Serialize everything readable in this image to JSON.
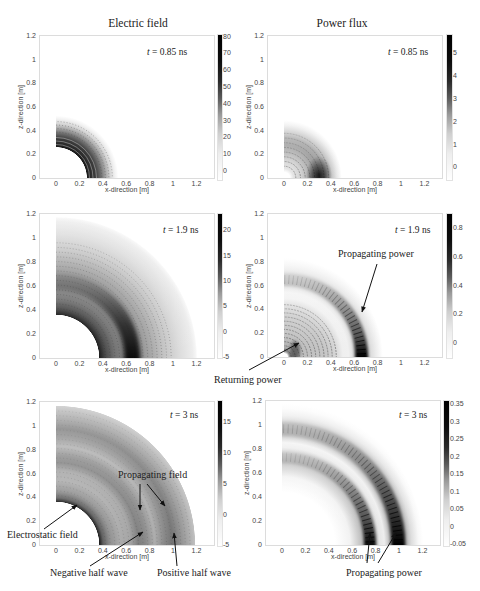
{
  "figure": {
    "column_titles": [
      "Electric field",
      "Power flux"
    ]
  },
  "chart_data": [
    {
      "type": "heatmap",
      "title": "Electric field",
      "time": {
        "symbol": "t",
        "value": "= 0.85 ns"
      },
      "xlabel": "x-direction [m]",
      "ylabel": "z-direction [m]",
      "xlim": [
        -0.137,
        1.35
      ],
      "ylim": [
        0,
        1.2
      ],
      "xticks": [
        0,
        0.2,
        0.4,
        0.6,
        0.8,
        1,
        1.2
      ],
      "yticks": [
        0,
        0.2,
        0.4,
        0.6,
        0.8,
        1,
        1.2
      ],
      "colorbar": {
        "range": [
          -5.4,
          81
        ],
        "ticks": [
          0,
          10,
          20,
          30,
          40,
          50,
          60,
          70,
          80
        ],
        "colormap": "inverted gray"
      },
      "grid": false,
      "bands": [
        {
          "r_m": [
            0.26,
            0.38
          ],
          "level": "high"
        },
        {
          "r_m": [
            0.38,
            0.5
          ],
          "level": "fading"
        }
      ],
      "annotations": []
    },
    {
      "type": "heatmap",
      "title": "Power flux",
      "time": {
        "symbol": "t",
        "value": "= 0.85 ns"
      },
      "xlabel": "x-direction [m]",
      "ylabel": "z-direction [m]",
      "xlim": [
        -0.137,
        1.35
      ],
      "ylim": [
        0,
        1.2
      ],
      "xticks": [
        0,
        0.2,
        0.4,
        0.6,
        0.8,
        1,
        1.2
      ],
      "yticks": [
        0,
        0.2,
        0.4,
        0.6,
        0.8,
        1,
        1.2
      ],
      "colorbar": {
        "range": [
          -0.55,
          5.8
        ],
        "ticks": [
          0,
          1,
          2,
          3,
          4,
          5
        ],
        "colormap": "inverted gray"
      },
      "grid": false,
      "bands": [
        {
          "r_m": [
            0.08,
            0.45
          ],
          "level": "moderate"
        },
        {
          "peak_at_m": [
            0.3,
            0.03
          ],
          "level": "high"
        }
      ],
      "annotations": []
    },
    {
      "type": "heatmap",
      "title": "Electric field",
      "time": {
        "symbol": "t",
        "value": "= 1.9 ns"
      },
      "xlabel": "x-direction [m]",
      "ylabel": "z-direction [m]",
      "xlim": [
        -0.137,
        1.35
      ],
      "ylim": [
        0,
        1.2
      ],
      "xticks": [
        0,
        0.2,
        0.4,
        0.6,
        0.8,
        1,
        1.2
      ],
      "yticks": [
        0,
        0.2,
        0.4,
        0.6,
        0.8,
        1,
        1.2
      ],
      "colorbar": {
        "range": [
          -5.2,
          23.2
        ],
        "ticks": [
          -5,
          0,
          5,
          10,
          15,
          20
        ],
        "colormap": "inverted gray"
      },
      "grid": false,
      "bands": [
        {
          "r_m": [
            0.37,
            0.42
          ],
          "level": "high"
        },
        {
          "r_m": [
            0.58,
            0.72
          ],
          "level": "high"
        },
        {
          "r_m": [
            0.72,
            1.2
          ],
          "level": "fading"
        }
      ],
      "annotations": []
    },
    {
      "type": "heatmap",
      "title": "Power flux",
      "time": {
        "symbol": "t",
        "value": "= 1.9 ns"
      },
      "xlabel": "x-direction [m]",
      "ylabel": "z-direction [m]",
      "xlim": [
        -0.137,
        1.35
      ],
      "ylim": [
        0,
        1.2
      ],
      "xticks": [
        0,
        0.2,
        0.4,
        0.6,
        0.8,
        1,
        1.2
      ],
      "yticks": [
        0,
        0.2,
        0.4,
        0.6,
        0.8,
        1,
        1.2
      ],
      "colorbar": {
        "range": [
          -0.105,
          0.9
        ],
        "ticks": [
          0,
          0.2,
          0.4,
          0.6,
          0.8
        ],
        "colormap": "inverted gray"
      },
      "grid": false,
      "bands": [
        {
          "r_m": [
            0.05,
            0.45
          ],
          "level": "moderate"
        },
        {
          "r_m": [
            0.58,
            0.74
          ],
          "level": "high"
        }
      ],
      "annotations": [
        {
          "text": "Propagating power",
          "target_m": [
            0.66,
            0.38
          ]
        },
        {
          "text": "Returning power",
          "target_m": [
            0.13,
            0.12
          ]
        }
      ]
    },
    {
      "type": "heatmap",
      "title": "Electric field",
      "time": {
        "symbol": "t",
        "value": "= 3 ns"
      },
      "xlabel": "x-direction [m]",
      "ylabel": "z-direction [m]",
      "xlim": [
        -0.137,
        1.35
      ],
      "ylim": [
        0,
        1.2
      ],
      "xticks": [
        0,
        0.2,
        0.4,
        0.6,
        0.8,
        1,
        1.2
      ],
      "yticks": [
        0,
        0.2,
        0.4,
        0.6,
        0.8,
        1,
        1.2
      ],
      "colorbar": {
        "range": [
          -5.1,
          18.4
        ],
        "ticks": [
          -5,
          0,
          5,
          10,
          15
        ],
        "colormap": "inverted gray"
      },
      "grid": false,
      "bands": [
        {
          "r_m": [
            0.37,
            0.4
          ],
          "level": "high"
        },
        {
          "r_m": [
            0.68,
            0.78
          ],
          "level": "negative half wave"
        },
        {
          "r_m": [
            0.92,
            1.02
          ],
          "level": "positive half wave"
        }
      ],
      "annotations": [
        {
          "text": "Propagating field",
          "target_m": [
            [
              0.72,
              0.29
            ],
            [
              0.93,
              0.33
            ]
          ]
        },
        {
          "text": "Electrostatic field",
          "target_m": [
            0.18,
            0.34
          ]
        },
        {
          "text": "Negative half wave",
          "target_m": [
            0.74,
            0.11
          ]
        },
        {
          "text": "Positive half wave",
          "target_m": [
            1.0,
            0.1
          ]
        }
      ]
    },
    {
      "type": "heatmap",
      "title": "Power flux",
      "time": {
        "symbol": "t",
        "value": "= 3 ns"
      },
      "xlabel": "x-direction [m]",
      "ylabel": "z-direction [m]",
      "xlim": [
        -0.137,
        1.35
      ],
      "ylim": [
        0,
        1.2
      ],
      "xticks": [
        0,
        0.2,
        0.4,
        0.6,
        0.8,
        1,
        1.2
      ],
      "yticks": [
        0,
        0.2,
        0.4,
        0.6,
        0.8,
        1,
        1.2
      ],
      "colorbar": {
        "range": [
          -0.055,
          0.36
        ],
        "ticks": [
          -0.05,
          0,
          0.05,
          0.1,
          0.15,
          0.2,
          0.25,
          0.3,
          0.35
        ],
        "colormap": "inverted gray"
      },
      "grid": false,
      "bands": [
        {
          "r_m": [
            0.68,
            0.8
          ],
          "level": "high"
        },
        {
          "r_m": [
            0.92,
            1.08
          ],
          "level": "high"
        }
      ],
      "annotations": [
        {
          "text": "Propagating power",
          "target_m": [
            [
              0.75,
              0.08
            ],
            [
              0.97,
              0.08
            ]
          ]
        }
      ]
    }
  ]
}
